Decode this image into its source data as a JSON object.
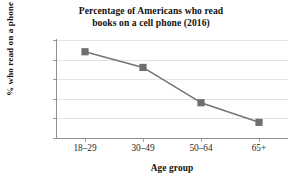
{
  "chart_data": {
    "type": "line",
    "title": "Percentage of Americans who read books on a cell phone (2016)",
    "title_line1": "Percentage of Americans who read",
    "title_line2": "books on a cell phone (2016)",
    "xlabel": "Age group",
    "ylabel": "% who read on a phone",
    "categories": [
      "18–29",
      "30–49",
      "50–64",
      "65+"
    ],
    "values": [
      22,
      18,
      9,
      4
    ],
    "ylim": [
      0,
      25
    ],
    "yticks": [
      0,
      5,
      10,
      15,
      20,
      25
    ],
    "ytick_labels": [
      "0",
      "5",
      "10",
      "15",
      "20",
      "25"
    ],
    "grid": true,
    "grid_axis": "y",
    "legend": "none",
    "series": [
      {
        "name": "% who read on a phone",
        "values": [
          22,
          18,
          9,
          4
        ],
        "marker": "square",
        "line_color": "#737373",
        "marker_color": "#6e6e6e"
      }
    ],
    "colors": {
      "line": "#737373",
      "marker": "#6e6e6e",
      "gridline": "#e4e4e4",
      "axis": "#8f8f8f",
      "text": "#111111",
      "background": "#ffffff"
    }
  }
}
